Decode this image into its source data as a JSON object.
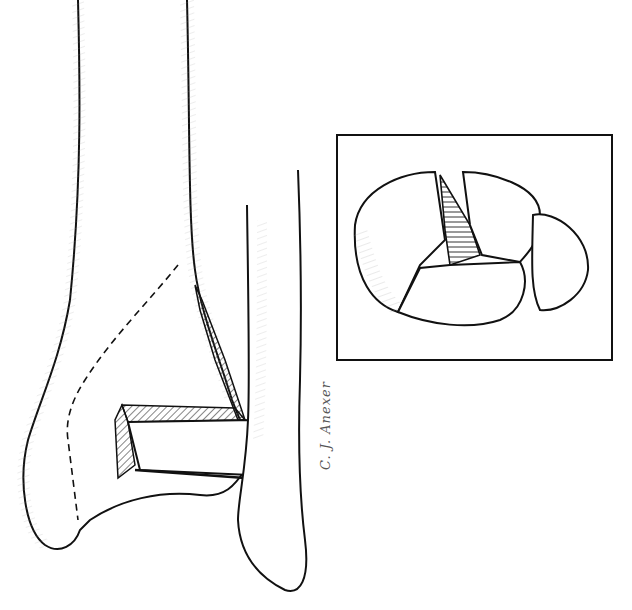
{
  "figure": {
    "type": "medical-line-illustration",
    "inset": {
      "subject": "Articular surface view showing fracture fragments",
      "frame": {
        "x": 337,
        "y": 135,
        "width": 275,
        "height": 225
      }
    },
    "signature": "C. J. Anexer",
    "colors": {
      "ink": "#111111",
      "background": "#ffffff",
      "hatch": "#333333"
    }
  }
}
